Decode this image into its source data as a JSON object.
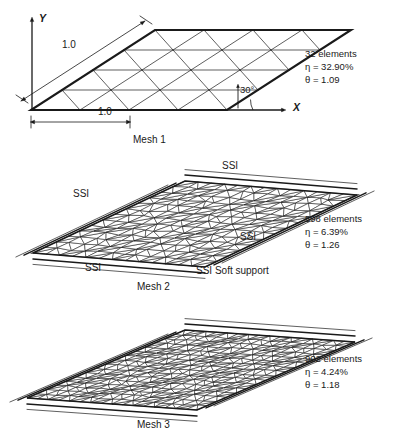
{
  "figure": {
    "background_color": "#ffffff",
    "line_color": "#1a1a1a"
  },
  "axes": {
    "x_label": "X",
    "y_label": "Y",
    "angle_label": "30°",
    "dim_top_label": "1.0",
    "dim_bottom_label": "1.0"
  },
  "meshes": [
    {
      "caption": "Mesh 1",
      "elements_label": "32 elements",
      "eta_label": "η = 32.90%",
      "theta_label": "θ = 1.09",
      "elements": 32,
      "eta": 32.9,
      "theta": 1.09,
      "type": "structured-triangular",
      "divisions": 4
    },
    {
      "caption": "Mesh 2",
      "elements_label": "598 elements",
      "eta_label": "η = 6.39%",
      "theta_label": "θ = 1.26",
      "elements": 598,
      "eta": 6.39,
      "theta": 1.26,
      "type": "unstructured-triangular",
      "divisions": 13
    },
    {
      "caption": "Mesh 3",
      "elements_label": "902 elements",
      "eta_label": "η = 4.24%",
      "theta_label": "θ = 1.18",
      "elements": 902,
      "eta": 4.24,
      "theta": 1.18,
      "type": "unstructured-triangular",
      "divisions": 16
    }
  ],
  "supports": {
    "ssi_top": "SSI",
    "ssi_left": "SSI",
    "ssi_right": "SSI",
    "ssi_bottom": "SSI",
    "legend": "SSI Soft support"
  }
}
